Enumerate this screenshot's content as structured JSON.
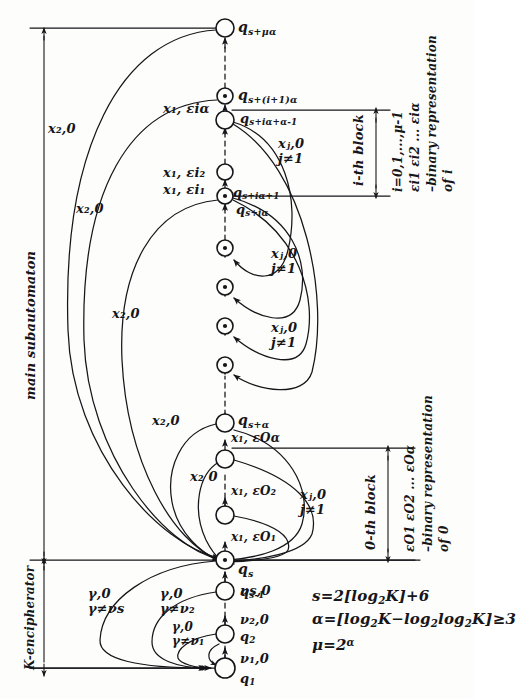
{
  "figure": {
    "kind": "hand-drawn state-transition diagram of an automaton",
    "background_color": "#fdfdfb",
    "ink_color": "#16161a"
  },
  "regions": {
    "main": {
      "label": "main subautomaton",
      "orientation": "vertical"
    },
    "encipherator": {
      "label": "K-encipherator",
      "orientation": "vertical"
    }
  },
  "blocks": {
    "i_block": {
      "name": "i-th block",
      "range": "i=0,1,...,μ-1",
      "binary": "εi1 εi2 ... εiα",
      "binary_note": "–binary representation",
      "binary_of": "of i"
    },
    "zero_block": {
      "name": "0-th block",
      "binary": "εO1 εO2 ... εOα",
      "binary_note": "–binary representation",
      "binary_of": "of 0"
    }
  },
  "states": [
    {
      "id": "q_s_mu_alpha",
      "label_main": "q",
      "label_sub": "s+μα",
      "x": 225,
      "y": 28,
      "r": 9,
      "accepting": false
    },
    {
      "id": "q_s_i1_alpha",
      "label_main": "q",
      "label_sub": "s+(i+1)α",
      "x": 225,
      "y": 96,
      "r": 8,
      "accepting": true
    },
    {
      "id": "q_s_ia_alpha_m1",
      "label_main": "q",
      "label_sub": "s+iα+α-1",
      "x": 225,
      "y": 120,
      "r": 9,
      "accepting": false
    },
    {
      "id": "q_dots_1",
      "label_main": "",
      "label_sub": "",
      "x": 225,
      "y": 172,
      "r": 8,
      "accepting": false
    },
    {
      "id": "q_s_ia_p1",
      "label_main": "q",
      "label_sub": "s+iα+1",
      "x": 225,
      "y": 196,
      "r": 8,
      "accepting": true
    },
    {
      "id": "q_mid_1",
      "label_main": "",
      "label_sub": "",
      "x": 225,
      "y": 248,
      "r": 8,
      "accepting": true
    },
    {
      "id": "q_mid_2",
      "label_main": "",
      "label_sub": "",
      "x": 225,
      "y": 287,
      "r": 8,
      "accepting": true
    },
    {
      "id": "q_mid_3",
      "label_main": "",
      "label_sub": "",
      "x": 225,
      "y": 326,
      "r": 8,
      "accepting": true
    },
    {
      "id": "q_mid_4",
      "label_main": "",
      "label_sub": "",
      "x": 225,
      "y": 365,
      "r": 8,
      "accepting": true
    },
    {
      "id": "q_s_alpha",
      "label_main": "q",
      "label_sub": "s+α",
      "x": 225,
      "y": 423,
      "r": 9,
      "accepting": false
    },
    {
      "id": "q_s_alpha_m1",
      "label_main": "",
      "label_sub": "",
      "x": 225,
      "y": 459,
      "r": 9,
      "accepting": false
    },
    {
      "id": "q_s_p1",
      "label_main": "",
      "label_sub": "",
      "x": 225,
      "y": 515,
      "r": 9,
      "accepting": false
    },
    {
      "id": "q_s",
      "label_main": "q",
      "label_sub": "s",
      "x": 225,
      "y": 560,
      "r": 9,
      "accepting": true
    },
    {
      "id": "q_s_minus_1",
      "label_main": "q",
      "label_sub": "s-1",
      "x": 225,
      "y": 591,
      "r": 9,
      "accepting": false
    },
    {
      "id": "q_2",
      "label_main": "q",
      "label_sub": "2",
      "x": 225,
      "y": 634,
      "r": 9,
      "accepting": false
    },
    {
      "id": "q_1",
      "label_main": "q",
      "label_sub": "1",
      "x": 225,
      "y": 668,
      "r": 10,
      "accepting": false
    }
  ],
  "edge_labels": {
    "x2_0": "x₂,0",
    "x2_0_short": "x₂ 0",
    "xj_0": "xⱼ,0",
    "j_ne_1": "j≠1",
    "x1_eia": "x₁, εiα",
    "x1_ei2": "x₁, εi₂",
    "x1_ei1": "x₁, εi₁",
    "x1_e0a": "x₁, εOα",
    "x1_e02": "x₁, εO₂",
    "x1_e01": "x₁, εO₁",
    "gamma_0": "γ,0",
    "gamma_ne_nus": "γ≠νs",
    "gamma_ne_nu2": "γ≠ν₂",
    "gamma_ne_nu1": "γ≠ν₁",
    "nu_s_0": "νs,0",
    "nu_2_0": "ν₂,0",
    "nu_1_0": "ν₁,0"
  },
  "formulas": [
    "s=2[log₂K]+6",
    "α=[log₂K−log₂log₂K]≥3",
    "μ=2α"
  ],
  "formula_parts": {
    "f1_lhs": "s=2[log",
    "f1_sub": "2",
    "f1_rhs": "K]+6",
    "f2_lhs": "α=[log",
    "f2_sub": "2",
    "f2_mid": "K−log",
    "f2_mid2": "log",
    "f2_rhs": "K]≥3",
    "f3_lhs": "μ=2",
    "f3_sup": "α"
  }
}
